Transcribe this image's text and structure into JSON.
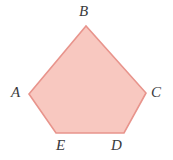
{
  "figure": {
    "kind": "geometry-diagram",
    "shape_name": "pentagon ABCDE",
    "background_color": "#ffffff",
    "fill_color": "#f8c8c0",
    "stroke_color": "#e8948c",
    "stroke_width": 1.6,
    "label_color": "#3a3a3c",
    "vertices": [
      {
        "id": "A",
        "label": "A",
        "x": 29,
        "y": 94,
        "label_x": 11,
        "label_y": 85
      },
      {
        "id": "B",
        "label": "B",
        "x": 86,
        "y": 26,
        "label_x": 79,
        "label_y": 4
      },
      {
        "id": "C",
        "label": "C",
        "x": 146,
        "y": 93,
        "label_x": 151,
        "label_y": 85
      },
      {
        "id": "D",
        "label": "D",
        "x": 124,
        "y": 133,
        "label_x": 111,
        "label_y": 138
      },
      {
        "id": "E",
        "label": "E",
        "x": 56,
        "y": 133,
        "label_x": 56,
        "label_y": 138
      }
    ],
    "polygon_points": "29,94 86,26 146,93 124,133 56,133"
  }
}
